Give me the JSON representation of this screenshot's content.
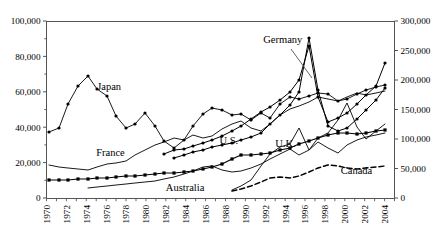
{
  "chart_data": {
    "type": "line",
    "title": "",
    "subtitle": "",
    "xlabel": "",
    "ylabel": "",
    "y2label": "",
    "grid": false,
    "legend_position": "inline-annotations",
    "x": [
      1970,
      1971,
      1972,
      1973,
      1974,
      1975,
      1976,
      1977,
      1978,
      1979,
      1980,
      1981,
      1982,
      1983,
      1984,
      1985,
      1986,
      1987,
      1988,
      1989,
      1990,
      1991,
      1992,
      1993,
      1994,
      1995,
      1996,
      1997,
      1998,
      1999,
      2000,
      2001,
      2002,
      2003,
      2004,
      2005
    ],
    "xlim": [
      1970,
      2005
    ],
    "ylim": [
      0,
      100000
    ],
    "y2lim": [
      0,
      300000
    ],
    "yticks": [
      0,
      20000,
      40000,
      60000,
      80000,
      100000
    ],
    "ytick_labels": [
      "0",
      "20,000",
      "40,000",
      "60,000",
      "80,000",
      "100,000"
    ],
    "y2ticks": [
      0,
      50000,
      100000,
      150000,
      200000,
      250000,
      300000
    ],
    "y2tick_labels": [
      "0",
      "50,000",
      "100,000",
      "150,000",
      "200,000",
      "250,000",
      "300,000"
    ],
    "xticks": [
      1970,
      1972,
      1974,
      1976,
      1978,
      1980,
      1982,
      1984,
      1986,
      1988,
      1990,
      1992,
      1994,
      1996,
      1998,
      2000,
      2002,
      2004
    ],
    "xtick_labels": [
      "1970",
      "1972",
      "1974",
      "1976",
      "1978",
      "1980",
      "1982",
      "1984",
      "1986",
      "1988",
      "1990",
      "1992",
      "1994",
      "1996",
      "1998",
      "2000",
      "2002",
      "2004"
    ],
    "series": [
      {
        "name": "Japan",
        "label": "Japan",
        "axis": "left",
        "style": "solid-marker",
        "marker": "dot",
        "label_x": 1975.1,
        "label_y": 61000,
        "values": [
          null,
          43000,
          44000,
          52000,
          58000,
          61500,
          56000,
          53500,
          48000,
          43000,
          38000,
          39000,
          41000,
          40000,
          38000,
          42000,
          36000,
          29000,
          27000,
          30000,
          35000,
          40000,
          46000,
          53000,
          60000,
          66000,
          67000,
          65500,
          63000,
          65000,
          67000,
          64000,
          63000,
          65500,
          68000,
          70000
        ]
      },
      {
        "name": "France",
        "label": "France",
        "axis": "left",
        "style": "solid-thin",
        "marker": "none",
        "label_x": 1975.0,
        "label_y": 23500,
        "values": [
          18500,
          17500,
          17000,
          16500,
          16000,
          17500,
          19000,
          19500,
          21000,
          24000,
          27000,
          30000,
          32000,
          34000,
          33000,
          36000,
          34500,
          35500,
          39500,
          42000,
          44000,
          40000,
          38000,
          42000,
          47000,
          51000,
          53000,
          55000,
          58000,
          57000,
          56000,
          58000,
          60000,
          59000,
          60000,
          61000
        ]
      },
      {
        "name": "U.S.",
        "label": "U.S.",
        "axis": "left",
        "style": "solid-marker",
        "marker": "square",
        "label_x": 1987.4,
        "label_y": 30500,
        "values": [
          10000,
          10000,
          10200,
          10500,
          10800,
          11000,
          11200,
          11500,
          12000,
          12500,
          13000,
          13500,
          14000,
          14500,
          15000,
          15500,
          16500,
          17500,
          19000,
          22000,
          24500,
          24500,
          25000,
          25500,
          27000,
          28500,
          30500,
          32000,
          33500,
          35000,
          36500,
          36000,
          35500,
          36500,
          37500,
          38500
        ]
      },
      {
        "name": "Germany",
        "label": "Germany",
        "axis": "right",
        "style": "solid-marker",
        "marker": "dot",
        "label_x": 1991.8,
        "label_y": 262000,
        "values": [
          null,
          null,
          null,
          null,
          null,
          null,
          null,
          null,
          null,
          null,
          null,
          null,
          null,
          null,
          null,
          null,
          null,
          null,
          null,
          null,
          null,
          null,
          null,
          null,
          null,
          null,
          null,
          null,
          null,
          null,
          null,
          null,
          null,
          null,
          null,
          null
        ]
      },
      {
        "name": "U.K.",
        "label": "U.K.",
        "axis": "right",
        "style": "solid-thin",
        "marker": "none",
        "label_x": 1993.0,
        "label_y": 86000,
        "values": [
          null,
          null,
          null,
          null,
          null,
          null,
          null,
          null,
          null,
          null,
          null,
          null,
          null,
          null,
          null,
          null,
          null,
          null,
          null,
          null,
          null,
          null,
          null,
          null,
          null,
          null,
          null,
          null,
          null,
          null,
          null,
          null,
          null,
          null,
          null,
          null
        ]
      },
      {
        "name": "Australia",
        "label": "Australia",
        "axis": "left",
        "style": "solid-thin",
        "marker": "none",
        "label_x": 1982.0,
        "label_y": 4200,
        "values": [
          null,
          null,
          null,
          null,
          6000,
          6200,
          6500,
          7000,
          7500,
          8000,
          8200,
          8500,
          9000,
          9500,
          10000,
          11000,
          12000,
          13500,
          15500,
          16000,
          14500,
          13500,
          14000,
          15000,
          17000,
          19000,
          22000,
          25000,
          23000,
          26000,
          30000,
          27000,
          25000,
          29000,
          32000,
          34000
        ]
      },
      {
        "name": "Canada",
        "label": "Canada",
        "axis": "right",
        "style": "dashed",
        "marker": "none",
        "label_x": 1999.6,
        "label_y": 41000,
        "values": [
          null,
          null,
          null,
          null,
          null,
          null,
          null,
          null,
          null,
          null,
          null,
          null,
          null,
          null,
          null,
          null,
          null,
          null,
          null,
          null,
          null,
          null,
          null,
          null,
          null,
          null,
          null,
          null,
          null,
          null,
          null,
          null,
          null,
          null,
          null,
          null
        ]
      }
    ],
    "annotations": [
      {
        "text": "Germany",
        "leader_line": true,
        "from_x": 1994.2,
        "from_y_px": 50,
        "to_x": 1997.0,
        "to_y_px": 72
      },
      {
        "text": "U.S.",
        "leader_line": false
      },
      {
        "text": "U.K.",
        "leader_line": false
      },
      {
        "text": "Japan",
        "leader_line": false
      },
      {
        "text": "France",
        "leader_line": false
      },
      {
        "text": "Australia",
        "leader_line": false
      },
      {
        "text": "Canada",
        "leader_line": false
      }
    ],
    "series_pixel_paths": {
      "japan": "49,132 59,128 68,104 78,86 88,76 97,89 107,96 116,116 126,128 135,124 145,113 155,126 164,141 174,148 184,140 193,126 203,114 212,108 222,110 232,115 241,114 251,120 261,113 270,118 280,104 290,97 299,99 309,96 318,93 328,94 338,101 347,99 357,94 366,90 376,87 385,85",
      "japan_markers": "49,132 59,128 68,104 78,86 88,76 97,89 107,96 116,116 126,128 135,124 145,113 155,126 164,141 174,148 184,140 193,126 203,114 212,108 222,110 232,115 241,114 251,120 261,113 270,118 280,104 290,97 299,99 309,96 318,93 328,94 338,101 347,99 357,94 366,90 376,87 385,85",
      "france": "49,165 59,167 68,168 78,169 88,170 97,167 107,164 116,163 126,161 135,155 145,150 155,145 164,142 174,138 184,140 193,135 203,138 212,136 222,129 232,124 241,121 251,128 261,131 270,124 280,115 290,109 299,106 309,102 318,97 328,99 338,101 347,97 357,93 366,95 376,93 385,91",
      "us": "49,180 59,180 68,180 78,179 88,179 97,178 107,178 116,177 126,176 135,176 145,175 155,174 164,173 174,173 184,172 193,171 203,169 212,167 222,164 232,159 241,155 251,155 261,154 270,153 280,150 290,148 299,144 309,141 318,138 328,135 338,133 347,133 357,134 366,133 376,131 385,130",
      "germany": "164,154 174,150 184,149 193,146 203,143 212,140 222,136 232,131 241,126 251,119 261,112 270,107 280,100 290,92 299,80 309,46 318,97 328,122 338,118 347,113 357,104 366,95 376,86 385,63",
      "germany2": "174,158 184,155 193,152 203,150 212,147 222,145 232,143 241,140 251,137 261,133 270,124 280,115 290,105 299,92 309,38 318,90 328,126 338,131 347,128 357,119 366,110 376,100 385,88",
      "uk": "232,190 241,186 251,180 261,166 270,154 280,147 290,144 299,128 309,150 318,138 328,133 338,120 347,103 357,127 366,139 376,131 385,124",
      "australia": "88,188 97,187 107,186 116,185 126,184 135,183 145,182 155,181 164,179 174,177 184,174 193,171 203,167 212,166 222,170 232,172 241,171 251,168 261,164 270,159 280,154 290,149 299,155 309,150 318,142 328,148 338,153 347,145 357,140 366,137 376,135 385,133",
      "canada": "232,191 241,189 251,186 261,182 270,178 280,177 290,178 299,176 309,172 318,168 328,165 338,166 347,168 357,169 366,168 376,167 385,166"
    }
  }
}
